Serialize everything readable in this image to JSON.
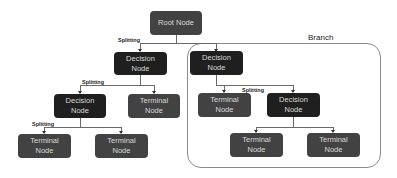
{
  "diagram": {
    "branch_label": "Branch",
    "edge_label": "Splitting",
    "colors": {
      "decision_node": "#1f1f1f",
      "terminal_node": "#424242",
      "root_node": "#424242",
      "node_text": "#d8d8d8",
      "edge": "#6a6a6a"
    },
    "nodes": {
      "root": {
        "line1": "Root Node",
        "line2": ""
      },
      "decision_1": {
        "line1": "Decision",
        "line2": "Node"
      },
      "decision_2": {
        "line1": "Decision",
        "line2": "Node"
      },
      "decision_3": {
        "line1": "Decision",
        "line2": "Node"
      },
      "decision_4": {
        "line1": "Decision",
        "line2": "Node"
      },
      "terminal_1": {
        "line1": "Terminal",
        "line2": "Node"
      },
      "terminal_2": {
        "line1": "Terminal",
        "line2": "Node"
      },
      "terminal_3": {
        "line1": "Terminal",
        "line2": "Node"
      },
      "terminal_4": {
        "line1": "Terminal",
        "line2": "Node"
      },
      "terminal_5": {
        "line1": "Terminal",
        "line2": "Node"
      },
      "terminal_6": {
        "line1": "Terminal",
        "line2": "Node"
      }
    },
    "splitting_labels": [
      "Splitting",
      "Splitting",
      "Splitting",
      "Splitting"
    ]
  }
}
